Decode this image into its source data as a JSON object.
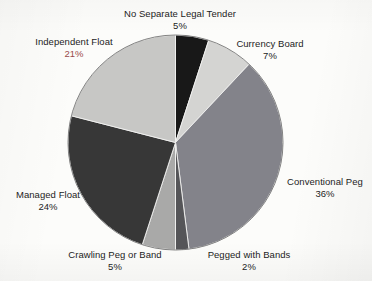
{
  "figure": {
    "background_color": "#fcfcfa",
    "text_color": "#1d1d1d",
    "highlight_color": "#9a4a4a"
  },
  "chart_data": {
    "type": "pie",
    "title": "",
    "subtitle": "",
    "xlabel": "",
    "ylabel": "",
    "legend_position": "none",
    "grid": false,
    "labels_outside": true,
    "value_suffix": "%",
    "start_angle_deg": 0,
    "direction": "clockwise",
    "categories": [
      "No Separate Legal Tender",
      "Currency Board",
      "Conventional Peg",
      "Pegged with Bands",
      "Crawling Peg or Band",
      "Managed Float",
      "Independent Float"
    ],
    "values": [
      5,
      7,
      36,
      2,
      5,
      24,
      21
    ],
    "value_labels": [
      "5%",
      "7%",
      "36%",
      "2%",
      "5%",
      "24%",
      "21%"
    ],
    "colors": [
      "#181818",
      "#d4d4d2",
      "#83838a",
      "#555558",
      "#a9a9a8",
      "#373737",
      "#c7c7c5"
    ],
    "slices": [
      {
        "label": "No Separate Legal Tender",
        "value": 5,
        "value_label": "5%",
        "color": "#181818"
      },
      {
        "label": "Currency Board",
        "value": 7,
        "value_label": "7%",
        "color": "#d4d4d2"
      },
      {
        "label": "Conventional Peg",
        "value": 36,
        "value_label": "36%",
        "color": "#83838a"
      },
      {
        "label": "Pegged with Bands",
        "value": 2,
        "value_label": "2%",
        "color": "#555558"
      },
      {
        "label": "Crawling Peg or Band",
        "value": 5,
        "value_label": "5%",
        "color": "#a9a9a8"
      },
      {
        "label": "Managed Float",
        "value": 24,
        "value_label": "24%",
        "color": "#373737"
      },
      {
        "label": "Independent Float",
        "value": 21,
        "value_label": "21%",
        "color": "#c7c7c5"
      }
    ]
  }
}
